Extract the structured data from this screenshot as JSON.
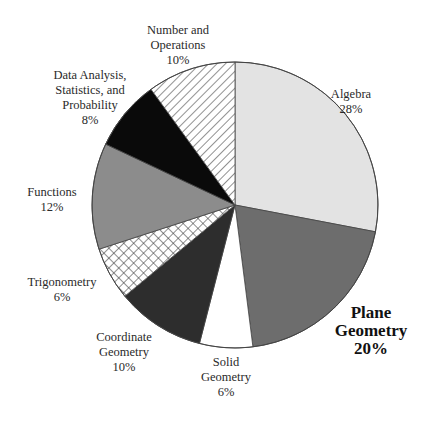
{
  "chart_data": {
    "type": "pie",
    "title": "",
    "start_angle_deg": 0,
    "direction": "clockwise",
    "center": [
      235,
      205
    ],
    "radius": 143,
    "slices": [
      {
        "id": "algebra",
        "label_lines": [
          "Algebra"
        ],
        "value": 28,
        "value_label": "28%",
        "fill": "#e3e3e3",
        "pattern": "solid",
        "bold": false,
        "label_pos": [
          351,
          87
        ]
      },
      {
        "id": "plane-geometry",
        "label_lines": [
          "Plane",
          "Geometry"
        ],
        "value": 20,
        "value_label": "20%",
        "fill": "#6d6d6d",
        "pattern": "solid",
        "bold": true,
        "label_pos": [
          371,
          304
        ]
      },
      {
        "id": "solid-geometry",
        "label_lines": [
          "Solid",
          "Geometry"
        ],
        "value": 6,
        "value_label": "6%",
        "fill": "#ffffff",
        "pattern": "solid",
        "bold": false,
        "label_pos": [
          226,
          355
        ]
      },
      {
        "id": "coordinate-geometry",
        "label_lines": [
          "Coordinate",
          "Geometry"
        ],
        "value": 10,
        "value_label": "10%",
        "fill": "#2d2d2d",
        "pattern": "solid",
        "bold": false,
        "label_pos": [
          124,
          330
        ]
      },
      {
        "id": "trigonometry",
        "label_lines": [
          "Trigonometry"
        ],
        "value": 6,
        "value_label": "6%",
        "fill": "#ffffff",
        "pattern": "crosshatch",
        "bold": false,
        "label_pos": [
          62,
          275
        ]
      },
      {
        "id": "functions",
        "label_lines": [
          "Functions"
        ],
        "value": 12,
        "value_label": "12%",
        "fill": "#8c8c8c",
        "pattern": "solid",
        "bold": false,
        "label_pos": [
          52,
          185
        ]
      },
      {
        "id": "data-analysis",
        "label_lines": [
          "Data Analysis,",
          "Statistics, and",
          "Probability"
        ],
        "value": 8,
        "value_label": "8%",
        "fill": "#0a0a0a",
        "pattern": "solid",
        "bold": false,
        "label_pos": [
          90,
          68
        ]
      },
      {
        "id": "number-operations",
        "label_lines": [
          "Number and",
          "Operations"
        ],
        "value": 10,
        "value_label": "10%",
        "fill": "#ffffff",
        "pattern": "diagonal",
        "bold": false,
        "label_pos": [
          178,
          23
        ]
      }
    ],
    "categories": [
      "Algebra",
      "Plane Geometry",
      "Solid Geometry",
      "Coordinate Geometry",
      "Trigonometry",
      "Functions",
      "Data Analysis, Statistics, and Probability",
      "Number and Operations"
    ],
    "values": [
      28,
      20,
      6,
      10,
      6,
      12,
      8,
      10
    ],
    "unit": "%",
    "legend": "none (direct labels)",
    "highlighted": "Plane Geometry"
  },
  "colors": {
    "outline": "#444444",
    "hatch": "#555555",
    "background": "#ffffff"
  }
}
